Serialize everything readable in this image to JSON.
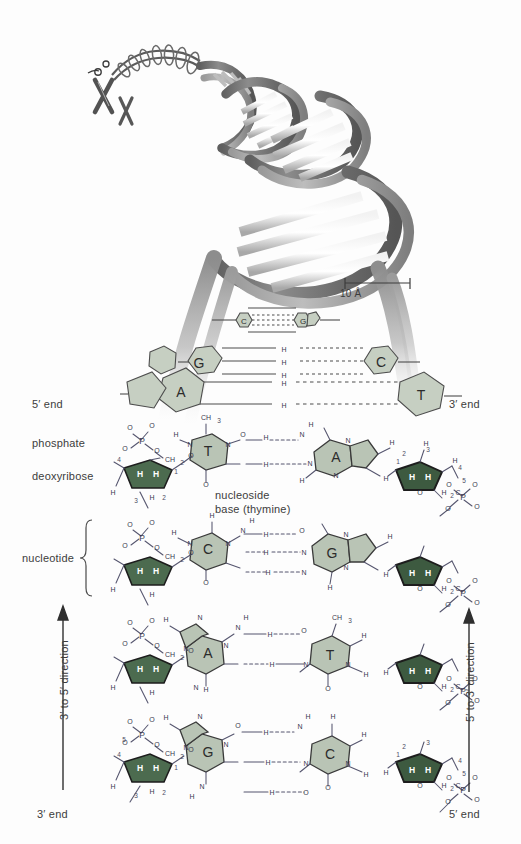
{
  "figure": {
    "background_color": "#fdfdfd",
    "ink_color": "#3c3c3c"
  },
  "scale_bar": {
    "label": "10 Å",
    "value": 10,
    "unit": "Å"
  },
  "labels": {
    "five_prime_end_left": "5′ end",
    "three_prime_end_right": "3′ end",
    "three_prime_end_left": "3′ end",
    "five_prime_end_right": "5′ end",
    "phosphate": "phosphate",
    "deoxyribose": "deoxyribose",
    "nucleoside_line1": "nucleoside",
    "nucleoside_line2": "base (thymine)",
    "nucleotide": "nucleotide",
    "direction_left": "3′ to 5′ direction",
    "direction_right": "5′ to 3′ direction"
  },
  "colors": {
    "sugar_fill": "#4c6b4f",
    "sugar_fill_dark": "#3d5a40",
    "base_fill": "#b9c4b5",
    "base_fill_light": "#c6cfc2",
    "helix_dark": "#6e6e6e",
    "helix_mid": "#8f8f8f",
    "helix_light": "#d9d9d9",
    "bond": "#55556e",
    "hbond": "#5a5a7a"
  },
  "helix": {
    "type": "B-DNA double helix ribbon model",
    "chromosome_icon": "chromosome-icon",
    "turns": 4
  },
  "fanout_pairs": [
    {
      "left": "C",
      "right": "G",
      "size": "small",
      "hbonds": 3
    },
    {
      "left": "G",
      "right": "C",
      "size": "medium",
      "hbonds": 3
    },
    {
      "left": "A",
      "right": "T",
      "size": "large",
      "hbonds": 2
    }
  ],
  "base_pairs": [
    {
      "index": 1,
      "left_base": "T",
      "right_base": "A",
      "hbonds": 2,
      "left_kind": "pyrimidine",
      "right_kind": "purine"
    },
    {
      "index": 2,
      "left_base": "C",
      "right_base": "G",
      "hbonds": 3,
      "left_kind": "pyrimidine",
      "right_kind": "purine"
    },
    {
      "index": 3,
      "left_base": "A",
      "right_base": "T",
      "hbonds": 2,
      "left_kind": "purine",
      "right_kind": "pyrimidine"
    },
    {
      "index": 4,
      "left_base": "G",
      "right_base": "C",
      "hbonds": 3,
      "left_kind": "purine",
      "right_kind": "pyrimidine"
    }
  ],
  "atoms": {
    "P": "P",
    "O": "O",
    "N": "N",
    "H": "H",
    "C": "C",
    "O_minus": "O⁻",
    "CH2": "CH₂",
    "H2C": "H₂C",
    "CH3": "CH₃"
  },
  "primes": {
    "p1": "1′",
    "p2": "2′",
    "p3": "3′",
    "p4": "4′",
    "p5": "5′"
  }
}
